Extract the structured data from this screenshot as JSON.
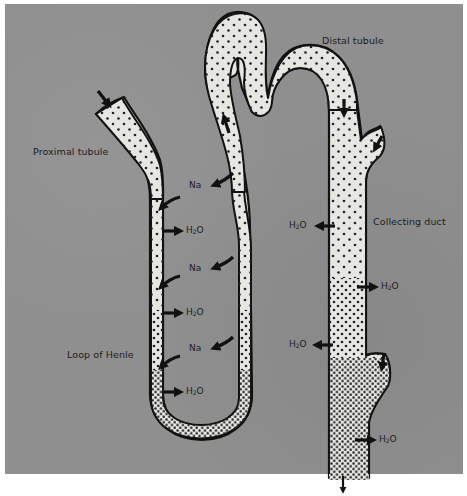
{
  "diagram": {
    "type": "nephron-water-sodium-transport",
    "colors": {
      "background": "#8f8f8f",
      "tubule_fill": "#e6e6e2",
      "outline": "#111111",
      "dot": "#222222",
      "page": "#ffffff"
    },
    "regions": {
      "proximal_tubule": "Proximal tubule",
      "distal_tubule": "Distal tubule",
      "collecting_duct": "Collecting duct",
      "loop_of_henle": "Loop of Henle"
    },
    "substances": {
      "sodium": "Na",
      "water_main": "H",
      "water_sub": "2",
      "water_tail": "O"
    },
    "annotations": [
      {
        "id": "na-1",
        "substance": "Na",
        "location": "descending/ascending limb upper",
        "direction": "out of ascending limb"
      },
      {
        "id": "h2o-1",
        "substance": "H2O",
        "location": "descending limb upper",
        "direction": "out"
      },
      {
        "id": "na-2",
        "substance": "Na",
        "location": "mid loop",
        "direction": "out of ascending limb"
      },
      {
        "id": "h2o-2",
        "substance": "H2O",
        "location": "descending limb mid",
        "direction": "out"
      },
      {
        "id": "na-3",
        "substance": "Na",
        "location": "lower loop",
        "direction": "out of ascending limb"
      },
      {
        "id": "h2o-3",
        "substance": "H2O",
        "location": "descending limb lower",
        "direction": "out"
      },
      {
        "id": "h2o-4",
        "substance": "H2O",
        "location": "collecting duct upper left",
        "direction": "out"
      },
      {
        "id": "h2o-5",
        "substance": "H2O",
        "location": "collecting duct upper right",
        "direction": "out"
      },
      {
        "id": "h2o-6",
        "substance": "H2O",
        "location": "collecting duct mid left",
        "direction": "out"
      },
      {
        "id": "h2o-7",
        "substance": "H2O",
        "location": "collecting duct lower right",
        "direction": "out"
      }
    ]
  }
}
